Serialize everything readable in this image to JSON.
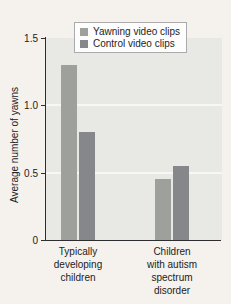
{
  "figure": {
    "ylabel": "Average number of yawns"
  },
  "chart_data": {
    "type": "bar",
    "title": "",
    "xlabel": "",
    "ylabel": "Average number of yawns",
    "categories": [
      "Typically developing children",
      "Children with autism spectrum disorder"
    ],
    "category_display": [
      "Typically\ndeveloping\nchildren",
      "Children\nwith autism\nspectrum\ndisorder"
    ],
    "series": [
      {
        "name": "Yawning video clips",
        "values": [
          1.3,
          0.45
        ],
        "color": "#9da09b"
      },
      {
        "name": "Control video clips",
        "values": [
          0.8,
          0.55
        ],
        "color": "#85878a"
      }
    ],
    "ylim": [
      0,
      1.5
    ],
    "ytick_labels": [
      "0",
      "0.5",
      "1.0",
      "1.5"
    ],
    "ytick_values": [
      0,
      0.5,
      1.0,
      1.5
    ],
    "grid": "faint white horizontal gridlines at 0.5 and 1.0 on shaded panel",
    "legend_position": "top-center",
    "colors": {
      "page_bg": "#f5f1ed",
      "panel_bg": "#e8e8e5",
      "axis": "#2e2e2e",
      "gridline": "rgba(255,255,255,0.65)",
      "text": "#222222",
      "legend_bg": "#fdfdfd",
      "legend_border": "#ababab"
    }
  }
}
